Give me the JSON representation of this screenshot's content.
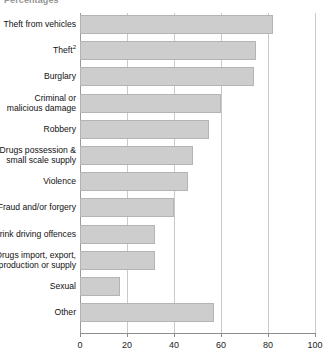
{
  "chart_data": {
    "type": "bar",
    "orientation": "horizontal",
    "title": "Percentages",
    "xlabel": "",
    "ylabel": "",
    "xlim": [
      0,
      100
    ],
    "xticks": [
      0,
      20,
      40,
      60,
      80,
      100
    ],
    "grid": true,
    "legend": false,
    "categories": [
      "Theft from vehicles",
      "Theft",
      "Burglary",
      "Criminal or\nmalicious damage",
      "Robbery",
      "Drugs possession &\nsmall scale supply",
      "Violence",
      "Fraud and/or forgery",
      "Drink driving offences",
      "Drugs import, export,\nproduction or supply",
      "Sexual",
      "Other"
    ],
    "category_footnotes": {
      "Theft": "2"
    },
    "values": [
      82,
      75,
      74,
      60,
      55,
      48,
      46,
      40,
      32,
      32,
      17,
      57
    ],
    "bar_color": "#cdcdcd",
    "bar_border_color": "#b4b4b4",
    "gridline_color": "#c9c9c9",
    "axis_color": "#8d8d8d"
  }
}
